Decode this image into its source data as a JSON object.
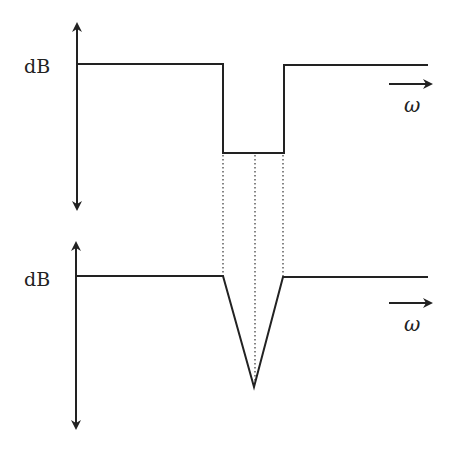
{
  "diagram": {
    "top_panel": {
      "y_label": "dB",
      "x_label": "ω",
      "shape": "rectangular-notch"
    },
    "bottom_panel": {
      "y_label": "dB",
      "x_label": "ω",
      "shape": "v-notch"
    },
    "colors": {
      "line": "#222222",
      "background": "#ffffff"
    }
  }
}
